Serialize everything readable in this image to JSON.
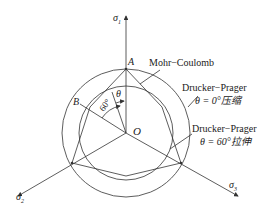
{
  "axes": {
    "sigma1": {
      "symbol": "σ",
      "sub": "1"
    },
    "sigma2": {
      "symbol": "σ",
      "sub": "2"
    },
    "sigma3": {
      "symbol": "σ",
      "sub": "3"
    }
  },
  "points": {
    "A": "A",
    "B": "B",
    "O": "O"
  },
  "angles": {
    "theta": "θ",
    "sixty": "60°"
  },
  "labels": {
    "mohr": "Mohr−Coulomb",
    "dp1_name": "Drucker−Prager",
    "dp1_cond": "θ = 0°压缩",
    "dp2_name": "Drucker−Prager",
    "dp2_cond": "θ = 60°拉伸"
  },
  "colors": {
    "line": "#333333",
    "background": "#ffffff"
  }
}
